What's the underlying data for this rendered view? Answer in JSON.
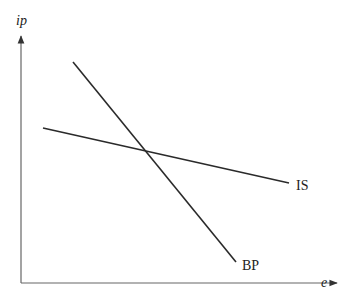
{
  "diagram": {
    "type": "IS-BP model",
    "axes": {
      "y_label": "ip",
      "x_label": "e"
    },
    "curves": [
      {
        "name": "IS",
        "label": "IS",
        "slope": "gently downward"
      },
      {
        "name": "BP",
        "label": "BP",
        "slope": "steeply downward"
      }
    ],
    "colors": {
      "axis": "#555555",
      "curve": "#2a2a2a",
      "text": "#222222"
    }
  }
}
